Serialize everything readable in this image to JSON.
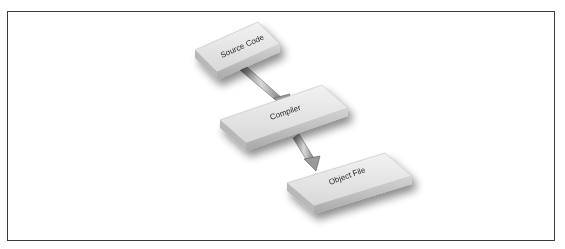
{
  "diagram": {
    "type": "flow",
    "direction": "top-left to bottom-right",
    "nodes": [
      {
        "id": "source",
        "label": "Source Code"
      },
      {
        "id": "compiler",
        "label": "Compiler"
      },
      {
        "id": "object",
        "label": "Object File"
      }
    ],
    "edges": [
      {
        "from": "source",
        "to": "compiler"
      },
      {
        "from": "compiler",
        "to": "object"
      }
    ]
  },
  "colors": {
    "frame_border": "#3a3a3a",
    "slab_top": "#e8e8e8",
    "slab_front": "#c9c9c9",
    "slab_side": "#b0b0b0",
    "arrow": "#9a9a9a",
    "label": "#2a2a2a"
  }
}
